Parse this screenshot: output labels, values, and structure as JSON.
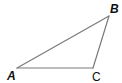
{
  "figure": {
    "type": "triangle",
    "edge_color": "#7a7a7a",
    "vertices": [
      {
        "name": "A",
        "x": 17,
        "y": 68,
        "label": "A",
        "label_x": 8,
        "label_y": 80,
        "style": "italic-bold"
      },
      {
        "name": "B",
        "x": 109,
        "y": 16,
        "label": "B",
        "label_x": 110,
        "label_y": 13,
        "style": "italic-bold"
      },
      {
        "name": "C",
        "x": 93,
        "y": 68,
        "label": "C",
        "label_x": 92,
        "label_y": 80,
        "style": "plain"
      }
    ],
    "edges": [
      {
        "from": "A",
        "to": "B"
      },
      {
        "from": "B",
        "to": "C"
      },
      {
        "from": "C",
        "to": "A"
      }
    ]
  },
  "labels": {
    "a": "A",
    "b": "B",
    "c": "C"
  }
}
